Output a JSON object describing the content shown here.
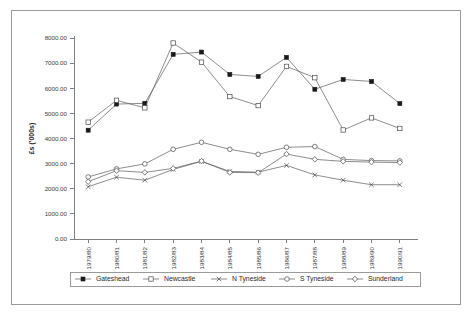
{
  "chart_data": {
    "type": "line",
    "title": "",
    "xlabel": "",
    "ylabel": "£s ('000s)",
    "ylim": [
      0,
      8000
    ],
    "ytick_step": 1000,
    "grid": false,
    "legend_position": "bottom",
    "categories": [
      "1979/80",
      "1980/81",
      "1981/82",
      "1982/83",
      "1983/84",
      "1984/85",
      "1985/86",
      "1986/87",
      "1987/88",
      "1988/89",
      "1989/90",
      "1990/91"
    ],
    "ytick_labels": [
      "0.00",
      "1000.00",
      "2000.00",
      "3000.00",
      "4000.00",
      "5000.00",
      "6000.00",
      "7000.00",
      "8000.00"
    ],
    "series": [
      {
        "name": "Gateshead",
        "marker": "filled-square",
        "values": [
          4330,
          5370,
          5400,
          7350,
          7440,
          6550,
          6470,
          7230,
          5960,
          6350,
          6270,
          5390
        ]
      },
      {
        "name": "Newcastle",
        "marker": "open-square",
        "values": [
          4650,
          5520,
          5220,
          7800,
          7040,
          5670,
          5310,
          6870,
          6420,
          4340,
          4820,
          4400
        ]
      },
      {
        "name": "N Tyneside",
        "marker": "cross",
        "values": [
          2080,
          2460,
          2340,
          2770,
          3090,
          2690,
          2660,
          2930,
          2550,
          2340,
          2160,
          2160
        ]
      },
      {
        "name": "S Tyneside",
        "marker": "open-circle",
        "values": [
          2470,
          2790,
          2990,
          3570,
          3850,
          3570,
          3370,
          3650,
          3680,
          3170,
          3120,
          3110
        ]
      },
      {
        "name": "Sunderland",
        "marker": "open-diamond",
        "values": [
          2280,
          2720,
          2650,
          2810,
          3100,
          2650,
          2640,
          3380,
          3170,
          3090,
          3060,
          3040
        ]
      }
    ]
  },
  "legend": {
    "items": [
      {
        "label": "Gateshead"
      },
      {
        "label": "Newcastle"
      },
      {
        "label": "N Tyneside"
      },
      {
        "label": "S Tyneside"
      },
      {
        "label": "Sunderland"
      }
    ]
  }
}
